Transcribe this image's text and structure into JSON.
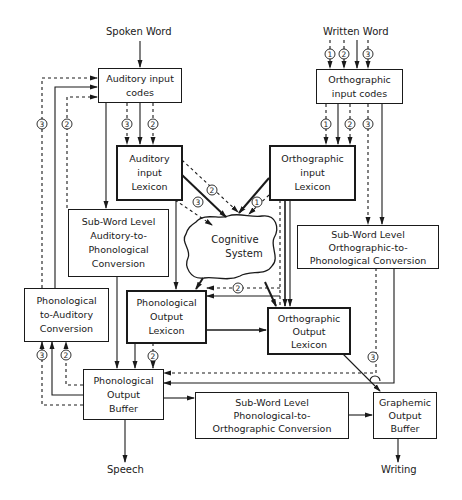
{
  "diagram": {
    "inputs": {
      "spoken_word": "Spoken Word",
      "written_word": "Written Word"
    },
    "outputs": {
      "speech": "Speech",
      "writing": "Writing"
    },
    "boxes": {
      "auditory_input_codes": [
        "Auditory input",
        "codes"
      ],
      "orthographic_input_codes": [
        "Orthographic",
        "input codes"
      ],
      "auditory_input_lexicon": [
        "Auditory",
        "input",
        "Lexicon"
      ],
      "orthographic_input_lexicon": [
        "Orthographic",
        "input",
        "Lexicon"
      ],
      "subword_aud_to_phon": [
        "Sub-Word Level",
        "Auditory-to-",
        "Phonological",
        "Conversion"
      ],
      "subword_orth_to_phon": [
        "Sub-Word Level",
        "Orthographic-to-",
        "Phonological Conversion"
      ],
      "cognitive_system": [
        "Cognitive",
        "System"
      ],
      "phon_to_auditory": [
        "Phonological",
        "to-Auditory",
        "Conversion"
      ],
      "phonological_output_lexicon": [
        "Phonological",
        "Output",
        "Lexicon"
      ],
      "orthographic_output_lexicon": [
        "Orthographic",
        "Output",
        "Lexicon"
      ],
      "phonological_output_buffer": [
        "Phonological",
        "Output",
        "Buffer"
      ],
      "subword_phon_to_orth": [
        "Sub-Word Level",
        "Phonological-to-",
        "Orthographic Conversion"
      ],
      "graphemic_output_buffer": [
        "Graphemic",
        "Output",
        "Buffer"
      ]
    },
    "route_markers": {
      "written_word": [
        "1",
        "2",
        "3"
      ],
      "orth_codes_to_lexicon": [
        "1",
        "2",
        "3"
      ],
      "aud_codes_to_lexicon": [
        "3",
        "2"
      ],
      "left_feedback": [
        "3",
        "2"
      ],
      "phon_to_aud_bottom": [
        "3",
        "2"
      ],
      "aud_lexicon_to_cognitive": [
        "2",
        "3"
      ],
      "orth_lexicon_to_cognitive": [
        "1"
      ],
      "cognitive_to_phon_output": [
        "2"
      ],
      "phon_output_lexicon_to_buffer": [
        "2"
      ],
      "orth_route_to_buffer": [
        "3"
      ]
    },
    "colors": {
      "line": "#1a1a1a",
      "background": "#ffffff"
    }
  }
}
